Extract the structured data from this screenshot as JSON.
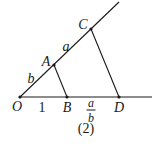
{
  "diagram": {
    "caption": "(2)",
    "colors": {
      "line": "#1a1a1a",
      "background": "#ffffff"
    },
    "points": [
      {
        "id": "O",
        "label": "O",
        "x": 20,
        "y": 97
      },
      {
        "id": "A",
        "label": "A",
        "x": 54,
        "y": 65
      },
      {
        "id": "C",
        "label": "C",
        "x": 91,
        "y": 29
      },
      {
        "id": "B",
        "label": "B",
        "x": 67,
        "y": 97
      },
      {
        "id": "D",
        "label": "D",
        "x": 119,
        "y": 97
      }
    ],
    "segments": [
      {
        "id": "ray-oblique",
        "from": "O",
        "to_xy": [
          119,
          2
        ]
      },
      {
        "id": "ray-horizontal",
        "from": "O",
        "to_xy": [
          152,
          97
        ]
      },
      {
        "id": "AB",
        "from": "A",
        "to": "B"
      },
      {
        "id": "CD",
        "from": "C",
        "to": "D"
      }
    ],
    "segment_labels": {
      "OA": "b",
      "AC": "a",
      "OB": "1",
      "BD_numerator": "a",
      "BD_denominator": "b"
    }
  }
}
